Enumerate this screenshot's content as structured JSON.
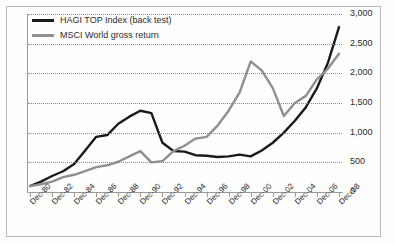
{
  "chart_data": {
    "type": "line",
    "title": "",
    "subtitle": "",
    "xlabel": "",
    "ylabel": "",
    "grid": true,
    "legend_position": "top-left",
    "xlim": [
      "Dec-79",
      "Dec-08"
    ],
    "ylim": [
      0,
      3000
    ],
    "yticks": [
      0,
      500,
      1000,
      1500,
      2000,
      2500,
      3000
    ],
    "ytick_labels": [
      "0",
      "500",
      "1,000",
      "1,500",
      "2,000",
      "2,500",
      "3,000"
    ],
    "xtick_labels": [
      "Dec-80",
      "Dec-82",
      "Dec-84",
      "Dec-86",
      "Dec-88",
      "Dec-90",
      "Dec-92",
      "Dec-94",
      "Dec-96",
      "Dec-98",
      "Dec-00",
      "Dec-02",
      "Dec-04",
      "Dec-06",
      "Dec-08"
    ],
    "x": [
      "Dec-80",
      "Dec-81",
      "Dec-82",
      "Dec-83",
      "Dec-84",
      "Dec-85",
      "Dec-86",
      "Dec-87",
      "Dec-88",
      "Dec-89",
      "Dec-90",
      "Dec-91",
      "Dec-92",
      "Dec-93",
      "Dec-94",
      "Dec-95",
      "Dec-96",
      "Dec-97",
      "Dec-98",
      "Dec-99",
      "Dec-00",
      "Dec-01",
      "Dec-02",
      "Dec-03",
      "Dec-04",
      "Dec-05",
      "Dec-06",
      "Dec-07",
      "Dec-08"
    ],
    "series": [
      {
        "name": "HAGI TOP Index (back test)",
        "color": "#1a1a1a",
        "values": [
          100,
          175,
          270,
          350,
          470,
          700,
          930,
          960,
          1150,
          1270,
          1370,
          1330,
          830,
          690,
          680,
          620,
          610,
          590,
          600,
          630,
          600,
          700,
          830,
          1000,
          1200,
          1430,
          1750,
          2180,
          2780
        ]
      },
      {
        "name": "MSCI World gross return",
        "color": "#8f8f8f",
        "values": [
          100,
          130,
          175,
          250,
          290,
          350,
          420,
          450,
          510,
          600,
          690,
          500,
          520,
          690,
          780,
          900,
          930,
          1120,
          1370,
          1680,
          2200,
          2050,
          1750,
          1280,
          1500,
          1620,
          1900,
          2080,
          2330
        ]
      }
    ]
  },
  "legend": {
    "items": [
      {
        "label": "HAGI TOP Index (back test)",
        "color": "#1a1a1a"
      },
      {
        "label": "MSCI World gross return",
        "color": "#8f8f8f"
      }
    ]
  }
}
